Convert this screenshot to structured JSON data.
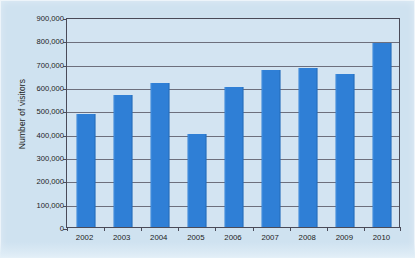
{
  "figure": {
    "background_color": "#cfe2f0",
    "plot_background_color": "#d3e4f2",
    "axis_color": "#4a4a58",
    "bar_color": "#2f7fd6"
  },
  "chart_data": {
    "type": "bar",
    "title": "",
    "xlabel": "",
    "ylabel": "Number of visitors",
    "categories": [
      "2002",
      "2003",
      "2004",
      "2005",
      "2006",
      "2007",
      "2008",
      "2009",
      "2010"
    ],
    "values": [
      485000,
      565000,
      617000,
      397000,
      600000,
      675000,
      681000,
      657000,
      790000
    ],
    "series": [
      {
        "name": "Number of visitors",
        "values": [
          485000,
          565000,
          617000,
          397000,
          600000,
          675000,
          681000,
          657000,
          790000
        ]
      }
    ],
    "ylim": [
      0,
      900000
    ],
    "ytick_values": [
      0,
      100000,
      200000,
      300000,
      400000,
      500000,
      600000,
      700000,
      800000,
      900000
    ],
    "ytick_labels": [
      "0",
      "100,000",
      "200,000",
      "300,000",
      "400,000",
      "500,000",
      "600,000",
      "700,000",
      "800,000",
      "900,000"
    ],
    "xtick_labels": [
      "2002",
      "2003",
      "2004",
      "2005",
      "2006",
      "2007",
      "2008",
      "2009",
      "2010"
    ],
    "grid": "horizontal",
    "legend": "none",
    "legend_position": "none",
    "bar_color": "#2f7fd6",
    "annotations": []
  }
}
